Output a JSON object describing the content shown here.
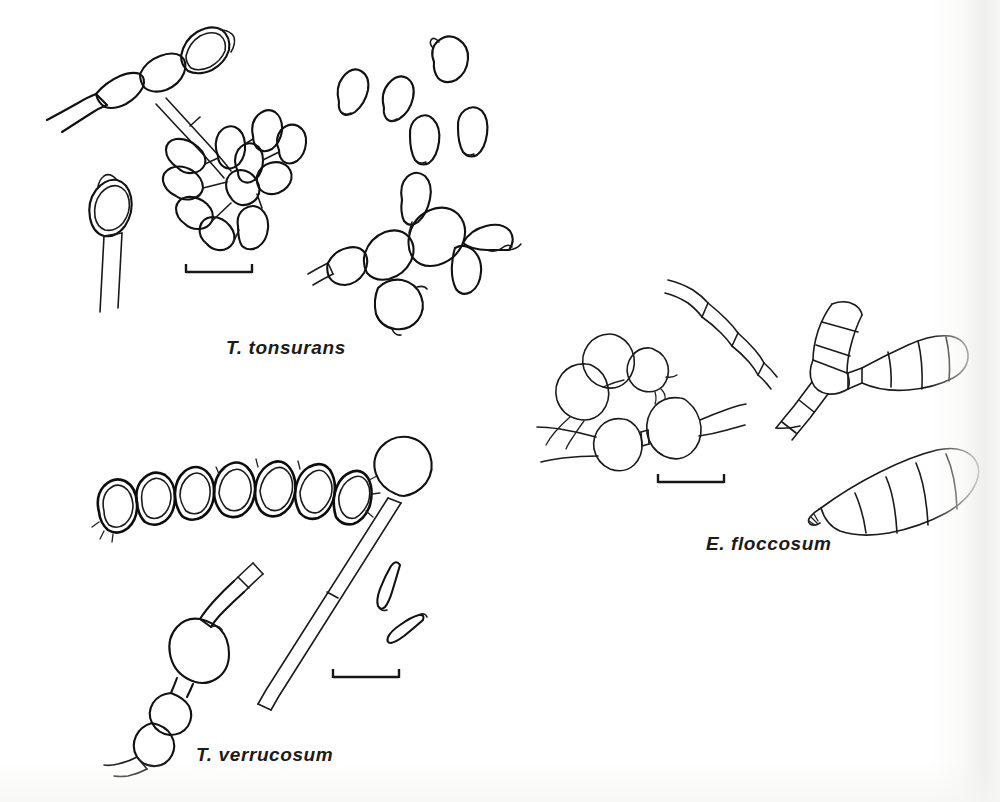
{
  "figure": {
    "kind": "scientific-line-drawing-plate",
    "background_color": "#ffffff",
    "ink_color": "#111111",
    "width": 1000,
    "height": 802
  },
  "panels": [
    {
      "id": "t-tonsurans",
      "label": "T. tonsurans",
      "label_position": {
        "x": 226,
        "y": 337
      },
      "structures": [
        "hyphal chain with terminal thick-walled chlamydospore",
        "stalked terminal chlamydospore",
        "cluster of clavate microconidia on hyphae",
        "scattered free microconidia",
        "swollen balloon-form hyphal chain"
      ],
      "scale_bar": {
        "x1": 186,
        "x2": 252,
        "y": 272
      }
    },
    {
      "id": "t-verrucosum",
      "label": "T. verrucosum",
      "label_position": {
        "x": 196,
        "y": 744
      },
      "structures": [
        "chain of seven thick-walled chlamydospores",
        "hypha with intercalary swollen chlamydospores",
        "long conidiophore with terminal globose chlamydospore",
        "two free elongate microconidia"
      ],
      "scale_bar": {
        "x1": 333,
        "x2": 399,
        "y": 677
      }
    },
    {
      "id": "e-floccosum",
      "label": "E. floccosum",
      "label_position": {
        "x": 706,
        "y": 533
      },
      "structures": [
        "cluster of globose chlamydospores on hyphae",
        "septate hypha",
        "two-celled and multi-celled smooth macroconidia",
        "clavate five-celled macroconidium with basal scar"
      ],
      "scale_bar": {
        "x1": 658,
        "x2": 724,
        "y": 482
      }
    }
  ],
  "labels": {
    "tonsurans": "T. tonsurans",
    "verrucosum": "T. verrucosum",
    "floccosum": "E. floccosum"
  }
}
